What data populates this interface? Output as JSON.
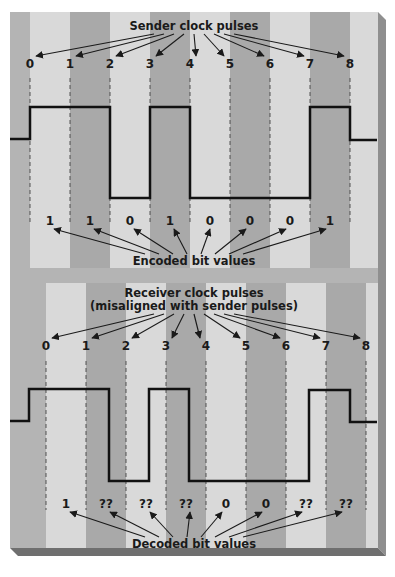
{
  "colors": {
    "background": "#b4b4b4",
    "stripe_light": "#d9d9d9",
    "stripe_dark": "#a9a9a9",
    "side_shade": "#8f8f8f",
    "bottom_shade": "#6f6f6f",
    "wave": "#111111",
    "text": "#1a1a1a"
  },
  "sender": {
    "title": "Sender clock pulses",
    "pulse_labels": [
      "0",
      "1",
      "2",
      "3",
      "4",
      "5",
      "6",
      "7",
      "8"
    ],
    "pulse_x": [
      30,
      70,
      110,
      150,
      190,
      230,
      270,
      310,
      350
    ],
    "bits_caption": "Encoded bit values",
    "bits": [
      "1",
      "1",
      "0",
      "1",
      "0",
      "0",
      "0",
      "1"
    ]
  },
  "receiver": {
    "title_line1": "Receiver clock pulses",
    "title_line2": "(misaligned with sender pulses)",
    "pulse_labels": [
      "0",
      "1",
      "2",
      "3",
      "4",
      "5",
      "6",
      "7",
      "8"
    ],
    "pulse_x": [
      46,
      86,
      126,
      166,
      206,
      246,
      286,
      326,
      366
    ],
    "bits_caption": "Decoded bit values",
    "bits": [
      "1",
      "??",
      "??",
      "??",
      "0",
      "0",
      "??",
      "??"
    ]
  }
}
